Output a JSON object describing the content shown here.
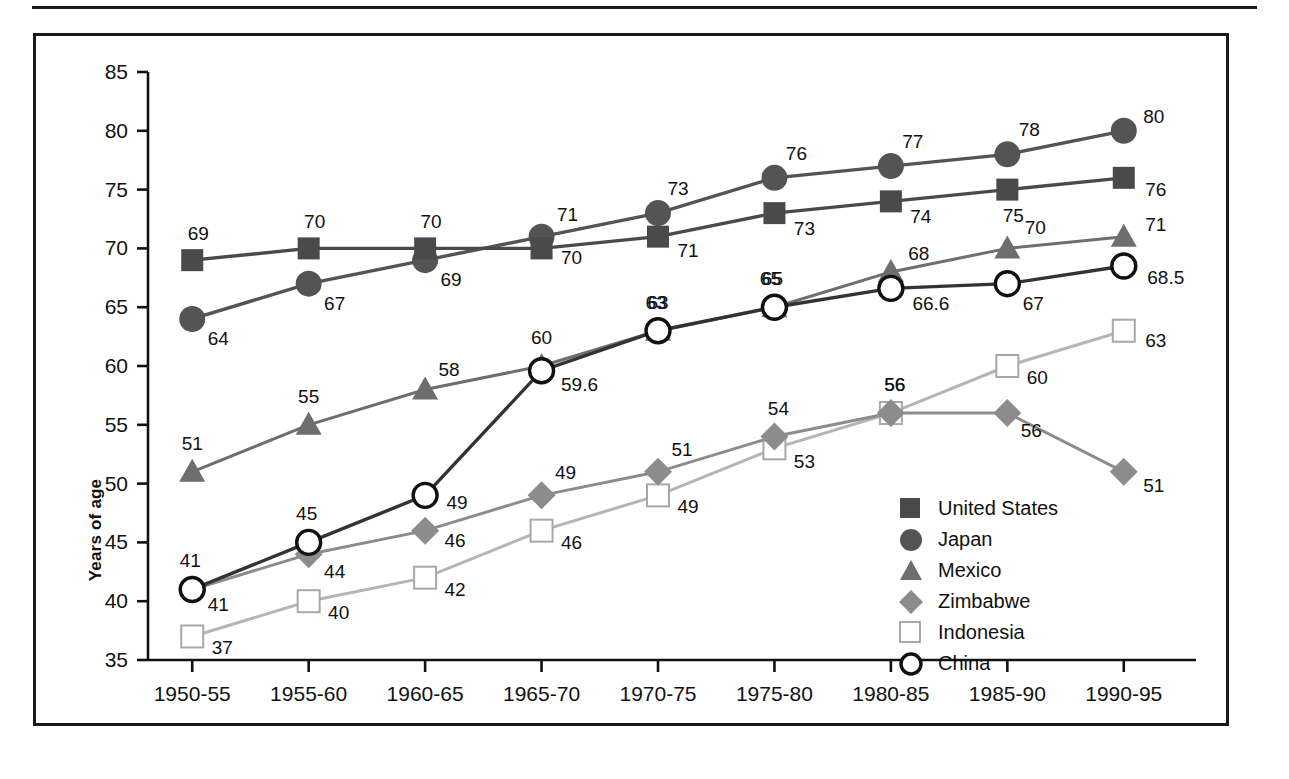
{
  "chart_data": {
    "type": "line",
    "title": "",
    "xlabel": "",
    "ylabel": "Years of age",
    "ylim": [
      35,
      85
    ],
    "yticks": [
      35,
      40,
      45,
      50,
      55,
      60,
      65,
      70,
      75,
      80,
      85
    ],
    "grid": false,
    "legend_position": "inside-lower-right",
    "categories": [
      "1950-55",
      "1955-60",
      "1960-65",
      "1965-70",
      "1970-75",
      "1975-80",
      "1980-85",
      "1985-90",
      "1990-95"
    ],
    "series": [
      {
        "name": "United States",
        "marker": "filled-square",
        "color": "#4a4a4a",
        "values": [
          69,
          70,
          70,
          70,
          71,
          73,
          74,
          75,
          76
        ],
        "labels": [
          "69",
          "70",
          "70",
          "70",
          "71",
          "73",
          "74",
          "75",
          "76"
        ]
      },
      {
        "name": "Japan",
        "marker": "filled-circle",
        "color": "#545454",
        "values": [
          64,
          67,
          69,
          71,
          73,
          76,
          77,
          78,
          80
        ],
        "labels": [
          "64",
          "67",
          "69",
          "71",
          "73",
          "76",
          "77",
          "78",
          "80"
        ]
      },
      {
        "name": "Mexico",
        "marker": "filled-triangle",
        "color": "#6e6e6e",
        "values": [
          51,
          55,
          58,
          60,
          63,
          65,
          68,
          70,
          71
        ],
        "labels": [
          "51",
          "55",
          "58",
          "60",
          "63",
          "65",
          "68",
          "70",
          "71"
        ]
      },
      {
        "name": "Zimbabwe",
        "marker": "filled-diamond",
        "color": "#8c8c8c",
        "values": [
          41,
          44,
          46,
          49,
          51,
          54,
          56,
          56,
          51
        ],
        "labels": [
          "41",
          "44",
          "46",
          "49",
          "51",
          "54",
          "56",
          "56",
          "51"
        ]
      },
      {
        "name": "Indonesia",
        "marker": "open-square",
        "color": "#b5b5b5",
        "values": [
          37,
          40,
          42,
          46,
          49,
          53,
          56,
          60,
          63
        ],
        "labels": [
          "37",
          "40",
          "42",
          "46",
          "49",
          "53",
          "56",
          "60",
          "63"
        ]
      },
      {
        "name": "China",
        "marker": "open-circle",
        "color": "#333333",
        "values": [
          41,
          45,
          49,
          59.6,
          63,
          65,
          66.6,
          67,
          68.5
        ],
        "labels": [
          "41",
          "45",
          "49",
          "59.6",
          "63",
          "65",
          "66.6",
          "67",
          "68.5"
        ]
      }
    ]
  },
  "legend": {
    "items": [
      {
        "label": "United States"
      },
      {
        "label": "Japan"
      },
      {
        "label": "Mexico"
      },
      {
        "label": "Zimbabwe"
      },
      {
        "label": "Indonesia"
      },
      {
        "label": "China"
      }
    ]
  }
}
